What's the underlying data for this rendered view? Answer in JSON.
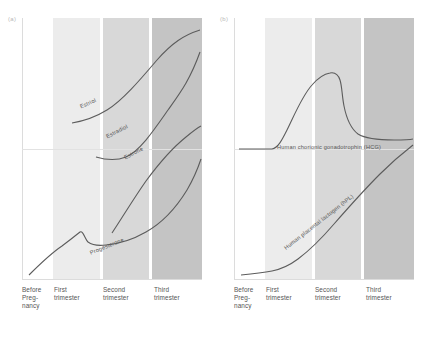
{
  "figure": {
    "panels": [
      {
        "tag": "(a)",
        "xlabels": [
          "Before\nPreg-\nnancy",
          "First\ntrimester",
          "Second\ntrimester",
          "Third\ntrimester"
        ],
        "curve_labels": [
          "Estriol",
          "Estradiol",
          "Estrone",
          "Progesterone"
        ]
      },
      {
        "tag": "(b)",
        "xlabels": [
          "Before\nPreg-\nnancy",
          "First\ntrimester",
          "Second\ntrimester",
          "Third\ntrimester"
        ],
        "curve_labels": [
          "Human chorionic gonadotrophin (HCG)",
          "Human placental lactogen (hPL)"
        ]
      }
    ],
    "band_colors": [
      "#ffffff",
      "#ececec",
      "#d8d8d8",
      "#c4c4c4"
    ],
    "curve_color": "#5c5c5c"
  },
  "chart_data": [
    {
      "type": "line",
      "title": "(a)",
      "xlabel": "",
      "ylabel": "",
      "grid": false,
      "legend": "inline-curve-labels",
      "categories": [
        "Before Pregnancy",
        "First trimester",
        "Second trimester",
        "Third trimester"
      ],
      "xlim": [
        0,
        4
      ],
      "ylim": [
        0,
        1
      ],
      "series": [
        {
          "name": "Estriol",
          "x": [
            1.1,
            1.5,
            2.0,
            2.5,
            3.0,
            3.5,
            3.95
          ],
          "values": [
            0.6,
            0.61,
            0.64,
            0.71,
            0.8,
            0.89,
            0.95
          ]
        },
        {
          "name": "Estradiol",
          "x": [
            1.65,
            2.0,
            2.4,
            2.8,
            3.2,
            3.6,
            3.95
          ],
          "values": [
            0.47,
            0.455,
            0.47,
            0.55,
            0.67,
            0.78,
            0.87
          ]
        },
        {
          "name": "Estrone",
          "x": [
            2.0,
            2.35,
            2.7,
            3.1,
            3.5,
            3.95
          ],
          "values": [
            0.18,
            0.3,
            0.41,
            0.5,
            0.56,
            0.6
          ]
        },
        {
          "name": "Progesterone",
          "x": [
            0.15,
            0.6,
            1.0,
            1.2,
            1.35,
            1.6,
            2.1,
            2.6,
            3.1,
            3.55,
            3.95
          ],
          "values": [
            0.02,
            0.09,
            0.14,
            0.19,
            0.14,
            0.13,
            0.145,
            0.17,
            0.23,
            0.34,
            0.46
          ]
        }
      ]
    },
    {
      "type": "line",
      "title": "(b)",
      "xlabel": "",
      "ylabel": "",
      "grid": false,
      "legend": "inline-curve-labels",
      "categories": [
        "Before Pregnancy",
        "First trimester",
        "Second trimester",
        "Third trimester"
      ],
      "xlim": [
        0,
        4
      ],
      "ylim": [
        0,
        1
      ],
      "series": [
        {
          "name": "Human chorionic gonadotrophin (HCG)",
          "x": [
            0.1,
            0.85,
            1.05,
            1.3,
            1.6,
            1.85,
            2.0,
            2.15,
            2.5,
            3.0,
            3.5,
            3.95
          ],
          "values": [
            0.5,
            0.5,
            0.58,
            0.72,
            0.82,
            0.84,
            0.83,
            0.66,
            0.56,
            0.545,
            0.54,
            0.545
          ]
        },
        {
          "name": "Human placental lactogen (hPL)",
          "x": [
            0.15,
            0.8,
            1.1,
            1.5,
            2.0,
            2.5,
            3.0,
            3.5,
            3.95
          ],
          "values": [
            0.02,
            0.025,
            0.045,
            0.09,
            0.155,
            0.225,
            0.3,
            0.39,
            0.47
          ]
        }
      ]
    }
  ]
}
